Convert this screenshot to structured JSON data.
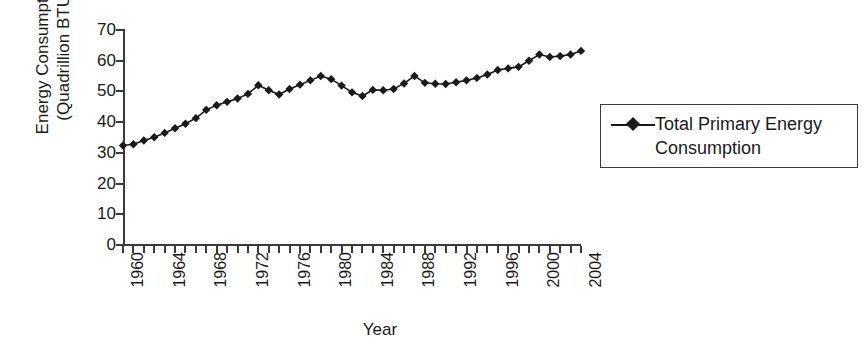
{
  "chart_data": {
    "type": "line",
    "title": "",
    "xlabel": "Year",
    "ylabel": "Energy Consumption (Quadrillion BTU)",
    "ylabel_line1": "Energy Consumption",
    "ylabel_line2": "(Quadrillion BTU)",
    "ylim": [
      0,
      70
    ],
    "yticks": [
      70,
      60,
      50,
      40,
      30,
      20,
      10,
      0
    ],
    "xlim": [
      1960,
      2004
    ],
    "xticks_all": [
      1960,
      1961,
      1962,
      1963,
      1964,
      1965,
      1966,
      1967,
      1968,
      1969,
      1970,
      1971,
      1972,
      1973,
      1974,
      1975,
      1976,
      1977,
      1978,
      1979,
      1980,
      1981,
      1982,
      1983,
      1984,
      1985,
      1986,
      1987,
      1988,
      1989,
      1990,
      1991,
      1992,
      1993,
      1994,
      1995,
      1996,
      1997,
      1998,
      1999,
      2000,
      2001,
      2002,
      2003,
      2004
    ],
    "xtick_labels": [
      "1960",
      "1964",
      "1968",
      "1972",
      "1976",
      "1980",
      "1984",
      "1988",
      "1992",
      "1996",
      "2000",
      "2004"
    ],
    "grid": false,
    "legend_position": "right",
    "marker": "diamond",
    "line_color": "#1a1a1a",
    "marker_color": "#1a1a1a",
    "series": [
      {
        "name": "Total Primary Energy Consumption",
        "x": [
          1960,
          1961,
          1962,
          1963,
          1964,
          1965,
          1966,
          1967,
          1968,
          1969,
          1970,
          1971,
          1972,
          1973,
          1974,
          1975,
          1976,
          1977,
          1978,
          1979,
          1980,
          1981,
          1982,
          1983,
          1984,
          1985,
          1986,
          1987,
          1988,
          1989,
          1990,
          1991,
          1992,
          1993,
          1994,
          1995,
          1996,
          1997,
          1998,
          1999,
          2000,
          2001,
          2002,
          2003,
          2004
        ],
        "values": [
          32.4,
          32.8,
          34.0,
          35.1,
          36.5,
          38.0,
          39.5,
          41.3,
          44.0,
          45.5,
          46.6,
          47.7,
          49.2,
          52.0,
          50.4,
          49.0,
          50.8,
          52.2,
          53.6,
          55.0,
          54.0,
          51.9,
          49.7,
          48.5,
          50.5,
          50.4,
          50.8,
          52.6,
          55.0,
          52.8,
          52.5,
          52.4,
          53.0,
          53.6,
          54.4,
          55.5,
          57.0,
          57.5,
          58.0,
          60.0,
          62.0,
          61.2,
          61.5,
          62.0,
          63.2
        ]
      }
    ]
  },
  "axis": {
    "y_title": "Energy Consumption (Quadrillion BTU)",
    "x_title": "Year"
  },
  "legend": {
    "entries": [
      {
        "label": "Total Primary Energy Consumption",
        "marker": "diamond-marker",
        "color": "#1a1a1a"
      }
    ]
  }
}
